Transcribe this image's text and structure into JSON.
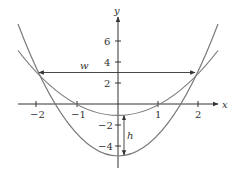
{
  "diagram": {
    "type": "function-plot",
    "axes": {
      "x_label": "x",
      "y_label": "y",
      "x_ticks": [
        {
          "value": -2,
          "label": "−2"
        },
        {
          "value": -1,
          "label": "−1"
        },
        {
          "value": 1,
          "label": "1"
        },
        {
          "value": 2,
          "label": "2"
        }
      ],
      "y_ticks": [
        {
          "value": 6,
          "label": "6"
        },
        {
          "value": 4,
          "label": "4"
        },
        {
          "value": 2,
          "label": "2"
        },
        {
          "value": -2,
          "label": "−2"
        },
        {
          "value": -4,
          "label": "−4"
        }
      ]
    },
    "curves": [
      {
        "name": "upper-parabola",
        "equation": "y = x^2 - 1",
        "vertex": [
          0,
          -1
        ]
      },
      {
        "name": "lower-parabola",
        "equation": "y = 2x^2 - 5",
        "vertex": [
          0,
          -5
        ]
      }
    ],
    "intersections": [
      [
        -2,
        3
      ],
      [
        2,
        3
      ]
    ],
    "annotations": {
      "width_label": "w",
      "height_label": "h"
    },
    "colors": {
      "curve": "#7a7a7a",
      "axis": "#333333",
      "text": "#333333"
    }
  }
}
